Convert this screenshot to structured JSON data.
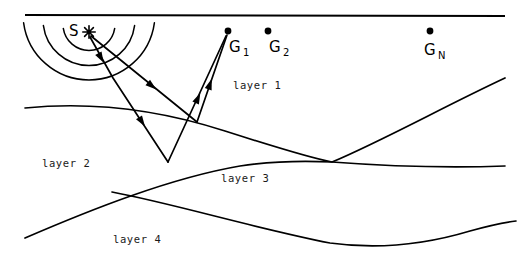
{
  "figure": {
    "width": 521,
    "height": 270,
    "background_color": "#ffffff",
    "ink_color": "#000000"
  },
  "source": {
    "label": "S",
    "symbol_name": "source-burst-asterisk",
    "x": 89,
    "y": 32,
    "label_x": 69,
    "label_y": 36
  },
  "geophones": [
    {
      "id": "G1",
      "label": "G",
      "subscript": "1",
      "x": 228,
      "y": 31,
      "label_x": 229,
      "label_y": 52,
      "sub_x": 243,
      "sub_y": 56
    },
    {
      "id": "G2",
      "label": "G",
      "subscript": "2",
      "x": 268,
      "y": 31,
      "label_x": 269,
      "label_y": 52,
      "sub_x": 283,
      "sub_y": 56
    },
    {
      "id": "GN",
      "label": "G",
      "subscript": "N",
      "x": 430,
      "y": 31,
      "label_x": 424,
      "label_y": 55,
      "sub_x": 438,
      "sub_y": 59
    }
  ],
  "layers": [
    {
      "name": "layer 1",
      "label_x": 233,
      "label_y": 89
    },
    {
      "name": "layer 2",
      "label_x": 42,
      "label_y": 167
    },
    {
      "name": "layer 3",
      "label_x": 221,
      "label_y": 182
    },
    {
      "name": "layer 4",
      "label_x": 113,
      "label_y": 243
    }
  ],
  "interfaces": [
    {
      "name": "ground-surface",
      "path": "M 25 15 L 505 16"
    },
    {
      "name": "layer1-layer2-interface",
      "path": "M 25 108 C 95 101, 160 110, 225 131 C 275 147, 310 158, 332 162 C 380 142, 445 106, 505 78"
    },
    {
      "name": "layer2-layer3-interface",
      "path": "M 25 238 C 90 210, 170 178, 240 166 C 280 160, 312 161, 332 162 C 385 166, 450 168, 505 166"
    },
    {
      "name": "layer3-layer4-interface",
      "path": "M 112 192 C 175 204, 250 227, 330 243 C 380 250, 430 243, 470 231 C 488 226, 500 223, 516 221"
    }
  ],
  "wavefronts": [
    {
      "name": "wavefront-arc-inner",
      "radius": 26
    },
    {
      "name": "wavefront-arc-middle",
      "radius": 46
    },
    {
      "name": "wavefront-arc-outer",
      "radius": 66
    }
  ],
  "rays": [
    {
      "name": "downgoing-ray-shallow",
      "description": "Down-going ray from source to shallow reflection point on layer1/layer2 interface",
      "path": "M 91 36 L 197 122",
      "arrow_at": {
        "x": 152,
        "y": 86,
        "angle": 39
      }
    },
    {
      "name": "upgoing-ray-shallow-to-G1",
      "description": "Up-going reflected ray from layer1/layer2 interface to geophone G1",
      "path": "M 197 122 L 227 35",
      "arrow_at": {
        "x": 210,
        "y": 84,
        "angle": -71
      }
    },
    {
      "name": "downgoing-ray-deep",
      "description": "Down-going ray from source through layer 1 into layer 2 to deep reflection point",
      "path": "M 90 37 L 113 78 L 168 162",
      "arrow_at": {
        "x": 101,
        "y": 58,
        "angle": 61
      }
    },
    {
      "name": "downgoing-ray-deep-segment",
      "description": "Refracted down-going segment in layer 2 toward layer2/layer3 interface",
      "path": "M 113 78 L 168 162",
      "arrow_at": {
        "x": 142,
        "y": 122,
        "angle": 57
      }
    },
    {
      "name": "upgoing-ray-deep-to-G1",
      "description": "Up-going reflected ray from layer2/layer3 interface to geophone G1",
      "path": "M 168 162 L 226 36",
      "arrow_at": {
        "x": 198,
        "y": 98,
        "angle": -65
      }
    }
  ]
}
